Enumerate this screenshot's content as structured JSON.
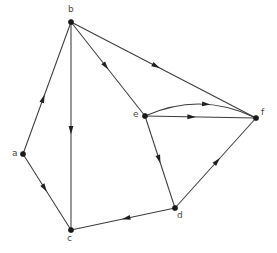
{
  "figure": {
    "background_color": "#ffffff",
    "edge_color": "#3c3c3c",
    "node_color": "#1a1a1a",
    "label_color": "#4a4a4a",
    "width": 277,
    "height": 253
  },
  "graph": {
    "type": "directed-multigraph",
    "node_count": 6,
    "edge_count": 10,
    "nodes": [
      {
        "id": "a",
        "label": "a",
        "x": 23,
        "y": 154,
        "label_x": 12,
        "label_y": 149
      },
      {
        "id": "b",
        "label": "b",
        "x": 71,
        "y": 22,
        "label_x": 68,
        "label_y": 5
      },
      {
        "id": "c",
        "label": "c",
        "x": 71,
        "y": 230,
        "label_x": 67,
        "label_y": 234
      },
      {
        "id": "d",
        "label": "d",
        "x": 175,
        "y": 208,
        "label_x": 177,
        "label_y": 211
      },
      {
        "id": "e",
        "label": "e",
        "x": 145,
        "y": 116,
        "label_x": 133,
        "label_y": 110
      },
      {
        "id": "f",
        "label": "f",
        "x": 256,
        "y": 118,
        "label_x": 261,
        "label_y": 108
      }
    ],
    "edges": [
      {
        "id": "edge-a-b",
        "from": "a",
        "to": "b",
        "curved": false,
        "arrow_t": 0.42
      },
      {
        "id": "edge-a-c",
        "from": "a",
        "to": "c",
        "curved": false,
        "arrow_t": 0.45
      },
      {
        "id": "edge-b-c",
        "from": "b",
        "to": "c",
        "curved": false,
        "arrow_t": 0.52
      },
      {
        "id": "edge-b-e",
        "from": "b",
        "to": "e",
        "curved": false,
        "arrow_t": 0.47
      },
      {
        "id": "edge-b-f",
        "from": "b",
        "to": "f",
        "curved": false,
        "arrow_t": 0.46
      },
      {
        "id": "edge-e-f-curved",
        "from": "e",
        "to": "f",
        "curved": true,
        "arrow_t": 0.55
      },
      {
        "id": "edge-e-f-straight",
        "from": "e",
        "to": "f",
        "curved": false,
        "arrow_t": 0.42
      },
      {
        "id": "edge-e-d",
        "from": "e",
        "to": "d",
        "curved": false,
        "arrow_t": 0.47
      },
      {
        "id": "edge-d-c",
        "from": "d",
        "to": "c",
        "curved": false,
        "arrow_t": 0.47
      },
      {
        "id": "edge-d-f",
        "from": "d",
        "to": "f",
        "curved": false,
        "arrow_t": 0.52
      }
    ]
  }
}
